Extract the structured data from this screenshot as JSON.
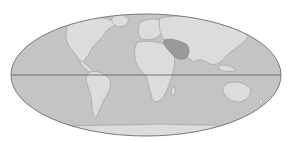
{
  "map": {
    "projection": "Mollweide-style world map (grayscale)",
    "colors": {
      "background": "#ffffff",
      "ocean": "#c4c4c4",
      "outline": "#7a7a7a",
      "land": "#dcdcdc",
      "land_edge": "#9a9a9a",
      "highlight": "#9a9a9a",
      "equator": "#555555"
    },
    "ellipse": {
      "cx": 146,
      "cy": 75,
      "rx": 135,
      "ry": 61
    },
    "equator_y": 75,
    "highlighted_region": "Middle East / Arabian Peninsula",
    "labels": []
  }
}
